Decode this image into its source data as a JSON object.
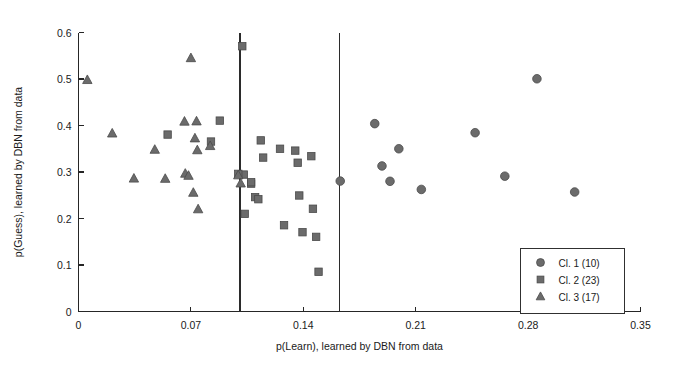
{
  "chart_data": {
    "type": "scatter",
    "title": "",
    "xlabel": "p(Learn), learned by DBN from data",
    "ylabel": "p(Guess), learned by DBN from data",
    "xlim": [
      0,
      0.35
    ],
    "ylim": [
      0,
      0.6
    ],
    "xticks": [
      "0",
      "0.07",
      "0.14",
      "0.21",
      "0.28",
      "0.35"
    ],
    "xtick_values": [
      0,
      0.07,
      0.14,
      0.21,
      0.28,
      0.35
    ],
    "yticks": [
      "0",
      "0.1",
      "0.2",
      "0.3",
      "0.4",
      "0.5",
      "0.6"
    ],
    "ytick_values": [
      0,
      0.1,
      0.2,
      0.3,
      0.4,
      0.5,
      0.6
    ],
    "grid": false,
    "legend_position": "lower right",
    "annotations": [
      {
        "name": "vertical-divider-1",
        "type": "vline",
        "x": 0.1005
      },
      {
        "name": "vertical-divider-2",
        "type": "vline",
        "x": 0.1625
      }
    ],
    "series": [
      {
        "name": "Cl. 1 (10)",
        "marker": "circle",
        "count": 10,
        "color": "#6b6b6b",
        "points": [
          [
            0.163,
            0.2805
          ],
          [
            0.1845,
            0.404
          ],
          [
            0.189,
            0.313
          ],
          [
            0.194,
            0.28
          ],
          [
            0.1995,
            0.35
          ],
          [
            0.2135,
            0.2625
          ],
          [
            0.247,
            0.3845
          ],
          [
            0.2655,
            0.291
          ],
          [
            0.2855,
            0.5005
          ],
          [
            0.309,
            0.257
          ]
        ]
      },
      {
        "name": "Cl. 2 (23)",
        "marker": "square",
        "count": 23,
        "color": "#6b6b6b",
        "points": [
          [
            0.0555,
            0.3805
          ],
          [
            0.088,
            0.4105
          ],
          [
            0.0825,
            0.3655
          ],
          [
            0.102,
            0.5705
          ],
          [
            0.103,
            0.2945
          ],
          [
            0.1035,
            0.21
          ],
          [
            0.1075,
            0.275
          ],
          [
            0.11,
            0.246
          ],
          [
            0.112,
            0.2415
          ],
          [
            0.1135,
            0.368
          ],
          [
            0.115,
            0.331
          ],
          [
            0.1255,
            0.35
          ],
          [
            0.128,
            0.1855
          ],
          [
            0.135,
            0.346
          ],
          [
            0.1365,
            0.32
          ],
          [
            0.1375,
            0.2495
          ],
          [
            0.1395,
            0.1705
          ],
          [
            0.145,
            0.334
          ],
          [
            0.146,
            0.221
          ],
          [
            0.148,
            0.1605
          ],
          [
            0.1495,
            0.0855
          ],
          [
            0.1075,
            0.278
          ],
          [
            0.0995,
            0.296
          ]
        ]
      },
      {
        "name": "Cl. 3 (17)",
        "marker": "triangle",
        "count": 17,
        "color": "#6b6b6b",
        "points": [
          [
            0.0055,
            0.498
          ],
          [
            0.021,
            0.383
          ],
          [
            0.0345,
            0.286
          ],
          [
            0.0475,
            0.348
          ],
          [
            0.054,
            0.2855
          ],
          [
            0.066,
            0.4085
          ],
          [
            0.0665,
            0.2965
          ],
          [
            0.0685,
            0.292
          ],
          [
            0.07,
            0.545
          ],
          [
            0.0715,
            0.2555
          ],
          [
            0.0725,
            0.3725
          ],
          [
            0.0735,
            0.409
          ],
          [
            0.074,
            0.347
          ],
          [
            0.0745,
            0.22
          ],
          [
            0.082,
            0.356
          ],
          [
            0.0995,
            0.293
          ],
          [
            0.101,
            0.2755
          ]
        ]
      }
    ]
  },
  "legend": {
    "entries": [
      {
        "label": "Cl. 1 (10)",
        "marker": "circle"
      },
      {
        "label": "Cl. 2 (23)",
        "marker": "square"
      },
      {
        "label": "Cl. 3 (17)",
        "marker": "triangle"
      }
    ]
  }
}
